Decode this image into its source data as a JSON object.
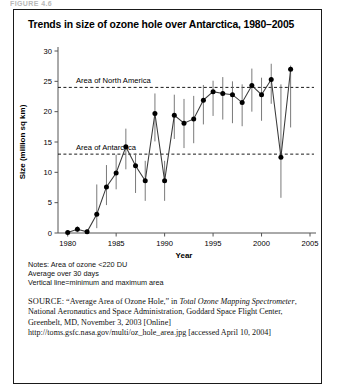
{
  "artifact": {
    "text": "FIGURE 4.6"
  },
  "figure": {
    "title": "Trends in size of ozone hole over Antarctica, 1980–2005",
    "notes": [
      "Notes: Area of ozone <220 DU",
      "Average over 30 days",
      "Vertical line=minimum and maximum area"
    ],
    "source": {
      "label": "SOURCE:",
      "part1": " “Average Area of Ozone Hole,” in ",
      "italic1": "Total Ozone Mapping Spectrometer",
      "part2": ", National Aeronautics and Space Administration, Goddard Space Flight Center, Greenbelt, MD, November 3, 2003 [Online] http://toms.gsfc.nasa.gov/multi/oz_hole_area.jpg [accessed April 10, 2004]"
    }
  },
  "chart_data": {
    "type": "line",
    "title": "Trends in size of ozone hole over Antarctica, 1980–2005",
    "xlabel": "Year",
    "ylabel": "Size (million sq km)",
    "xlim": [
      1979,
      2005
    ],
    "ylim": [
      0,
      30
    ],
    "xticks": [
      1980,
      1985,
      1990,
      1995,
      2000,
      2005
    ],
    "yticks": [
      0,
      5,
      10,
      15,
      20,
      25,
      30
    ],
    "grid": false,
    "legend": "none",
    "series_name": "Average area of ozone hole",
    "error_bar_meaning": "minimum and maximum area",
    "x": [
      1980,
      1981,
      1982,
      1983,
      1984,
      1985,
      1986,
      1987,
      1988,
      1989,
      1990,
      1991,
      1992,
      1993,
      1994,
      1995,
      1996,
      1997,
      1998,
      1999,
      2000,
      2001,
      2002,
      2003
    ],
    "values": [
      0.1,
      0.6,
      0.2,
      3.1,
      7.6,
      9.9,
      14.2,
      11.1,
      8.6,
      19.7,
      8.6,
      19.4,
      18.1,
      18.8,
      21.9,
      23.3,
      23.0,
      22.8,
      21.5,
      24.3,
      22.8,
      25.3,
      12.5,
      27.0
    ],
    "y_min": [
      0.0,
      0.1,
      0.0,
      0.8,
      4.6,
      7.2,
      10.5,
      6.6,
      5.3,
      15.1,
      5.3,
      15.5,
      14.0,
      14.8,
      17.9,
      19.3,
      18.7,
      18.1,
      17.6,
      20.0,
      18.5,
      21.3,
      5.8,
      17.4
    ],
    "y_max": [
      0.3,
      1.1,
      0.6,
      8.0,
      11.2,
      12.9,
      17.2,
      13.1,
      11.9,
      23.0,
      11.9,
      22.8,
      22.1,
      22.6,
      24.4,
      25.1,
      25.7,
      25.0,
      24.5,
      27.1,
      25.6,
      27.9,
      24.5,
      27.6
    ],
    "reference_lines": [
      {
        "label": "Area of North America",
        "value": 24,
        "style": "dashed"
      },
      {
        "label": "Area of Antarctica",
        "value": 13,
        "style": "dashed"
      }
    ]
  }
}
